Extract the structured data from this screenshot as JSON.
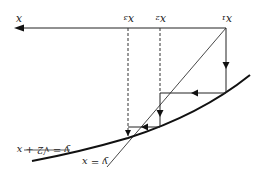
{
  "diagram": {
    "rotation_deg": 180,
    "axis_label": "x",
    "iterate_labels": [
      "x1",
      "x2",
      "x3"
    ],
    "iterate_labels_display": [
      "x₁",
      "x₂",
      "x₃"
    ],
    "curve_label": "y = √2 + x",
    "line_label": "y = x",
    "colors": {
      "ink": "#222222",
      "background": "#ffffff"
    }
  }
}
